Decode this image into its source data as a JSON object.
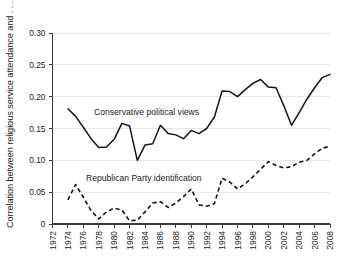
{
  "chart_data": {
    "type": "line",
    "title": "",
    "subtitle": "",
    "xlabel": "",
    "ylabel": "Correlation between religious service attendance and . . .",
    "xlim": [
      1972,
      2008
    ],
    "ylim": [
      0,
      0.3
    ],
    "grid": true,
    "legend_position": "inline-annotation",
    "x_ticks": [
      1972,
      1974,
      1976,
      1978,
      1980,
      1982,
      1984,
      1986,
      1988,
      1990,
      1992,
      1994,
      1996,
      1998,
      2000,
      2002,
      2004,
      2006,
      2008
    ],
    "x_tick_labels": [
      "1972",
      "1974",
      "1976",
      "1978",
      "1980",
      "1982",
      "1984",
      "1986",
      "1988",
      "1990",
      "1992",
      "1994",
      "1996",
      "1998",
      "2000",
      "2002",
      "2004",
      "2006",
      "2008"
    ],
    "y_ticks": [
      0,
      0.05,
      0.1,
      0.15,
      0.2,
      0.25,
      0.3
    ],
    "y_tick_labels": [
      "0",
      "0.05",
      "0.10",
      "0.15",
      "0.20",
      "0.25",
      "0.30"
    ],
    "series": [
      {
        "name": "Conservative political views",
        "style": "solid",
        "color": "#151515",
        "annotation": "Conservative political views",
        "x": [
          1974,
          1975,
          1976,
          1977,
          1978,
          1979,
          1980,
          1981,
          1982,
          1983,
          1984,
          1985,
          1986,
          1987,
          1988,
          1989,
          1990,
          1991,
          1992,
          1993,
          1994,
          1995,
          1996,
          1997,
          1998,
          1999,
          2000,
          2001,
          2002,
          2003,
          2004,
          2005,
          2006,
          2007,
          2008
        ],
        "values": [
          0.181,
          0.169,
          0.152,
          0.134,
          0.12,
          0.121,
          0.133,
          0.158,
          0.154,
          0.1,
          0.124,
          0.126,
          0.155,
          0.142,
          0.14,
          0.134,
          0.147,
          0.142,
          0.15,
          0.168,
          0.209,
          0.208,
          0.2,
          0.211,
          0.221,
          0.227,
          0.215,
          0.214,
          0.186,
          0.155,
          0.175,
          0.196,
          0.214,
          0.23,
          0.235
        ]
      },
      {
        "name": "Republican Party identification",
        "style": "dashed",
        "color": "#151515",
        "annotation": "Republican Party identification",
        "x": [
          1974,
          1975,
          1976,
          1977,
          1978,
          1979,
          1980,
          1981,
          1982,
          1983,
          1984,
          1985,
          1986,
          1987,
          1988,
          1989,
          1990,
          1991,
          1992,
          1993,
          1994,
          1995,
          1996,
          1997,
          1998,
          1999,
          2000,
          2001,
          2002,
          2003,
          2004,
          2005,
          2006,
          2007,
          2008
        ],
        "values": [
          0.038,
          0.062,
          0.042,
          0.021,
          0.008,
          0.019,
          0.025,
          0.022,
          0.005,
          0.006,
          0.019,
          0.033,
          0.035,
          0.026,
          0.033,
          0.043,
          0.055,
          0.03,
          0.028,
          0.032,
          0.072,
          0.066,
          0.055,
          0.063,
          0.074,
          0.086,
          0.098,
          0.092,
          0.088,
          0.09,
          0.097,
          0.1,
          0.11,
          0.119,
          0.122
        ]
      }
    ]
  },
  "annotations": {
    "conservative_label": "Conservative political views",
    "republican_label": "Republican Party identification"
  }
}
